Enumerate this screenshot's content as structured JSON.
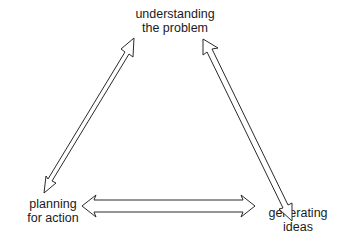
{
  "diagram": {
    "type": "cycle-triangle",
    "nodes": [
      {
        "id": "top",
        "lines": [
          "understanding",
          "the problem"
        ]
      },
      {
        "id": "left",
        "lines": [
          "planning",
          "for action"
        ]
      },
      {
        "id": "right",
        "lines": [
          "generating",
          "ideas"
        ]
      }
    ],
    "edges": [
      {
        "from": "top",
        "to": "left",
        "style": "double-headed hollow arrow"
      },
      {
        "from": "top",
        "to": "right",
        "style": "double-headed hollow arrow"
      },
      {
        "from": "left",
        "to": "right",
        "style": "double-headed hollow arrow"
      }
    ],
    "colors": {
      "background": "#ffffff",
      "stroke": "#2a2a2a",
      "text": "#1a1a1a"
    }
  }
}
